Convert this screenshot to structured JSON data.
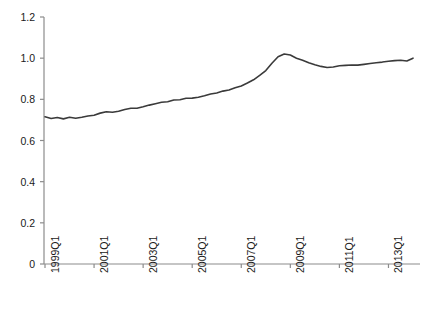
{
  "chart_data": {
    "type": "line",
    "title": "",
    "subtitle": "",
    "xlabel": "",
    "ylabel": "",
    "grid": false,
    "legend": null,
    "xlim": [
      "1999Q1",
      "2014Q1"
    ],
    "ylim": [
      0,
      1.2
    ],
    "ytick_labels": [
      "0",
      "0.2",
      "0.4",
      "0.6",
      "0.8",
      "1.0",
      "1.2"
    ],
    "ytick_values": [
      0,
      0.2,
      0.4,
      0.6,
      0.8,
      1.0,
      1.2
    ],
    "xtick_labels": [
      "1999Q1",
      "2001Q1",
      "2003Q1",
      "2005Q1",
      "2007Q1",
      "2009Q1",
      "2011Q1",
      "2013Q1"
    ],
    "xtick_values": [
      "1999Q1",
      "2001Q1",
      "2003Q1",
      "2005Q1",
      "2007Q1",
      "2009Q1",
      "2011Q1",
      "2013Q1"
    ],
    "line_color": "#3a3a3a",
    "line_width": 1.6,
    "axis_color": "#8c8c8c",
    "x": [
      "1999Q1",
      "1999Q2",
      "1999Q3",
      "1999Q4",
      "2000Q1",
      "2000Q2",
      "2000Q3",
      "2000Q4",
      "2001Q1",
      "2001Q2",
      "2001Q3",
      "2001Q4",
      "2002Q1",
      "2002Q2",
      "2002Q3",
      "2002Q4",
      "2003Q1",
      "2003Q2",
      "2003Q3",
      "2003Q4",
      "2004Q1",
      "2004Q2",
      "2004Q3",
      "2004Q4",
      "2005Q1",
      "2005Q2",
      "2005Q3",
      "2005Q4",
      "2006Q1",
      "2006Q2",
      "2006Q3",
      "2006Q4",
      "2007Q1",
      "2007Q2",
      "2007Q3",
      "2007Q4",
      "2008Q1",
      "2008Q2",
      "2008Q3",
      "2008Q4",
      "2009Q1",
      "2009Q2",
      "2009Q3",
      "2009Q4",
      "2010Q1",
      "2010Q2",
      "2010Q3",
      "2010Q4",
      "2011Q1",
      "2011Q2",
      "2011Q3",
      "2011Q4",
      "2012Q1",
      "2012Q2",
      "2012Q3",
      "2012Q4",
      "2013Q1",
      "2013Q2",
      "2013Q3",
      "2013Q4",
      "2014Q1"
    ],
    "values": [
      0.715,
      0.707,
      0.712,
      0.705,
      0.713,
      0.708,
      0.713,
      0.719,
      0.723,
      0.733,
      0.74,
      0.737,
      0.742,
      0.751,
      0.757,
      0.757,
      0.764,
      0.772,
      0.779,
      0.786,
      0.788,
      0.797,
      0.798,
      0.805,
      0.806,
      0.81,
      0.817,
      0.826,
      0.831,
      0.84,
      0.845,
      0.856,
      0.865,
      0.879,
      0.895,
      0.916,
      0.94,
      0.975,
      1.007,
      1.02,
      1.015,
      1.0,
      0.99,
      0.978,
      0.968,
      0.96,
      0.955,
      0.957,
      0.963,
      0.965,
      0.967,
      0.966,
      0.97,
      0.974,
      0.978,
      0.981,
      0.985,
      0.988,
      0.99,
      0.986,
      1.0
    ],
    "series_name": "index"
  },
  "axes": {
    "plot_left": 44,
    "plot_right": 420,
    "plot_top": 17,
    "plot_bottom": 264
  }
}
